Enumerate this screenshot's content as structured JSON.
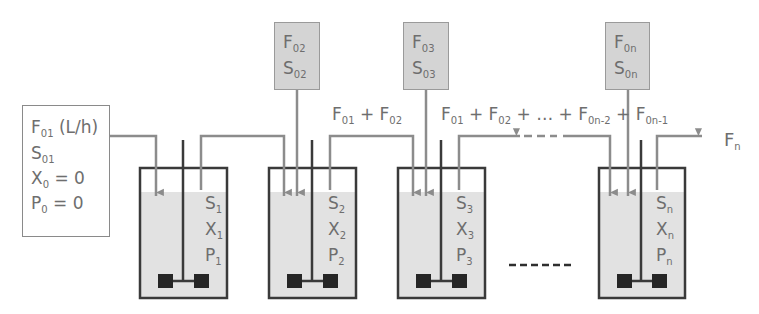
{
  "diagram": {
    "inlet_box": {
      "lines": [
        {
          "main": "F",
          "sub": "01",
          "suffix": " (L/h)"
        },
        {
          "main": "S",
          "sub": "01",
          "suffix": ""
        },
        {
          "main": "X",
          "sub": "0",
          "suffix": " = 0"
        },
        {
          "main": "P",
          "sub": "0",
          "suffix": " = 0"
        }
      ]
    },
    "feed_boxes": [
      {
        "id": "feed-2",
        "f_main": "F",
        "f_sub": "02",
        "s_main": "S",
        "s_sub": "02"
      },
      {
        "id": "feed-3",
        "f_main": "F",
        "f_sub": "03",
        "s_main": "S",
        "s_sub": "03"
      },
      {
        "id": "feed-n",
        "f_main": "F",
        "f_sub": "0n",
        "s_main": "S",
        "s_sub": "0n"
      }
    ],
    "flow_labels": {
      "between_2_3": [
        {
          "main": "F",
          "sub": "01"
        },
        {
          "op": " + "
        },
        {
          "main": "F",
          "sub": "02"
        }
      ],
      "after_3": [
        {
          "main": "F",
          "sub": "01"
        },
        {
          "op": " + "
        },
        {
          "main": "F",
          "sub": "02"
        },
        {
          "op": " + … + "
        },
        {
          "main": "F",
          "sub": "0n-2"
        },
        {
          "op": " + "
        },
        {
          "main": "F",
          "sub": "0n-1"
        }
      ],
      "outlet": {
        "main": "F",
        "sub": "n"
      }
    },
    "tanks": [
      {
        "id": "tank-1",
        "vars": [
          {
            "main": "S",
            "sub": "1"
          },
          {
            "main": "X",
            "sub": "1"
          },
          {
            "main": "P",
            "sub": "1"
          }
        ]
      },
      {
        "id": "tank-2",
        "vars": [
          {
            "main": "S",
            "sub": "2"
          },
          {
            "main": "X",
            "sub": "2"
          },
          {
            "main": "P",
            "sub": "2"
          }
        ]
      },
      {
        "id": "tank-3",
        "vars": [
          {
            "main": "S",
            "sub": "3"
          },
          {
            "main": "X",
            "sub": "3"
          },
          {
            "main": "P",
            "sub": "3"
          }
        ]
      },
      {
        "id": "tank-n",
        "vars": [
          {
            "main": "S",
            "sub": "n"
          },
          {
            "main": "X",
            "sub": "n"
          },
          {
            "main": "P",
            "sub": "n"
          }
        ]
      }
    ],
    "colors": {
      "tank_outline": "#3a3a3a",
      "liquid": "#e2e2e2",
      "pipe": "#8c8c8c",
      "feed_box_fill": "#d4d4d4",
      "impeller": "#262626",
      "text": "#6e6e6e"
    }
  }
}
